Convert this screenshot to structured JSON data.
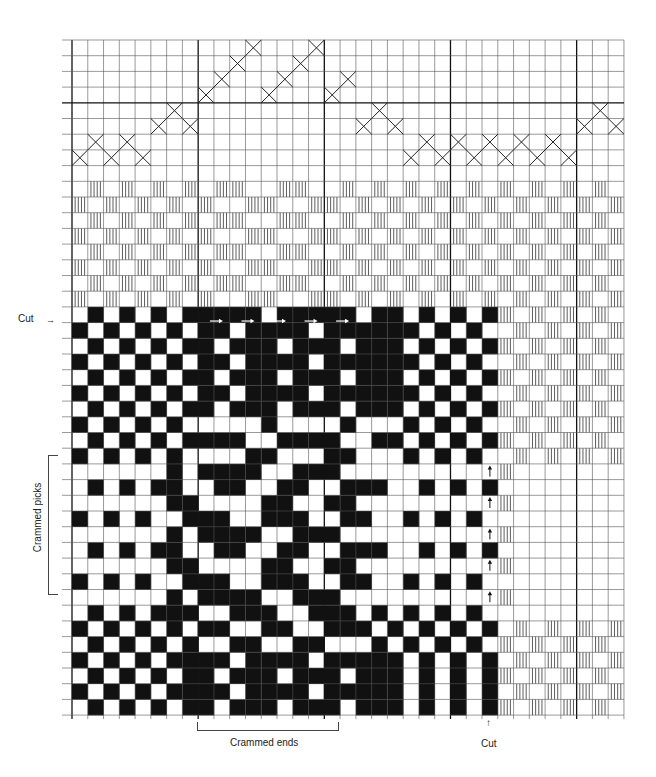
{
  "colors": {
    "ink": "#111111",
    "grid": "#555555",
    "paper": "#ffffff"
  },
  "grid": {
    "cols": 35,
    "rows": 43,
    "origin_x": 72,
    "origin_y": 40,
    "cell_w": 15.77,
    "cell_h": 15.7,
    "thick_cols": [
      0,
      8,
      16,
      24,
      32
    ],
    "thick_rows": [
      4
    ]
  },
  "tieup": {
    "description": "X marks in top grid (row index per column, rows 0-7)",
    "x_marks": [
      [
        0,
        7
      ],
      [
        1,
        6
      ],
      [
        2,
        7
      ],
      [
        3,
        6
      ],
      [
        4,
        7
      ],
      [
        5,
        5
      ],
      [
        6,
        4
      ],
      [
        7,
        5
      ],
      [
        8,
        3
      ],
      [
        9,
        2
      ],
      [
        10,
        1
      ],
      [
        11,
        0
      ],
      [
        12,
        3
      ],
      [
        13,
        2
      ],
      [
        14,
        1
      ],
      [
        15,
        0
      ],
      [
        16,
        3
      ],
      [
        17,
        2
      ],
      [
        18,
        5
      ],
      [
        19,
        4
      ],
      [
        20,
        5
      ],
      [
        21,
        7
      ],
      [
        22,
        6
      ],
      [
        23,
        7
      ],
      [
        24,
        6
      ],
      [
        25,
        7
      ],
      [
        26,
        6
      ],
      [
        27,
        7
      ],
      [
        28,
        6
      ],
      [
        29,
        7
      ],
      [
        30,
        6
      ],
      [
        31,
        7
      ],
      [
        32,
        5
      ],
      [
        33,
        4
      ],
      [
        34,
        5
      ]
    ]
  },
  "hatch_top": {
    "start_row": 9,
    "rows": [
      "01010101011001100101010101010101010",
      "10101010100110011010101010101010101",
      "01010101011001100101010101010101010",
      "10101010100110011010101010101010101",
      "01010101011001100101010101010101010",
      "10101010100110011010101010101010101",
      "01010101011001100101010101010101010",
      "10101010100110011010101010101010101"
    ]
  },
  "hatch_right": {
    "start_row": 17,
    "start_col": 27,
    "rows": [
      "10101010",
      "01010101",
      "10101010",
      "01010101",
      "10101010",
      "01010101",
      "10101010",
      "01010101",
      "10101010",
      "01010101",
      "10000000",
      "00000000",
      "10000000",
      "00000000",
      "10000000",
      "00000000",
      "10000000",
      "00000000",
      "10000000",
      "00000000",
      "01010101",
      "10101010",
      "01010101",
      "10101010",
      "01010101",
      "10101010"
    ]
  },
  "weave": {
    "start_row": 17,
    "rows": [
      "010101011111011111011010101",
      "101010101101111011111101010",
      "010101011011101110111010101",
      "101010101101111011111101010",
      "010101011011101110111010101",
      "101010101101111011111101010",
      "010101011011101110111010101",
      "101010100000100001000101010",
      "010101011110011110011010101",
      "101010100001100011000101010",
      "000000101111001110000000000",
      "010101100110011001110010101",
      "000000110000110011000000000",
      "101010011100111001100101010",
      "000000101111001110000000000",
      "010101100110011001110010101",
      "000000110000110011000000000",
      "101010011100111001100101010",
      "000000101111001110000000000",
      "010101110011100111010101010",
      "101010101100110011101010101",
      "010101010011001100010101010",
      "101010111101111011111010101",
      "010101011011101110111010101",
      "101010111101111011111010101",
      "010101011011101110111010101"
    ]
  },
  "arrows": {
    "right_arrows_row": 17,
    "right_arrows_cols": [
      9,
      11,
      13,
      15,
      17
    ],
    "up_arrows_col": 26,
    "up_arrows_rows": [
      27,
      29,
      31,
      33,
      35
    ]
  },
  "labels": {
    "cut_left": "Cut",
    "crammed_picks": "Crammed picks",
    "crammed_ends": "Crammed ends",
    "cut_bottom": "Cut"
  }
}
